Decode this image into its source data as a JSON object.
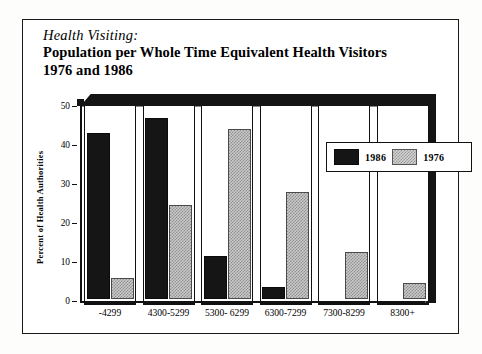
{
  "figure": {
    "title_sub": "Health Visiting:",
    "title_line1": "Population per Whole Time Equivalent Health Visitors",
    "title_line2": "1976 and 1986"
  },
  "legend": {
    "items": [
      {
        "label": "1986",
        "swatch": "solid-black-swatch"
      },
      {
        "label": "1976",
        "swatch": "dotted-grey-swatch"
      }
    ]
  },
  "axes": {
    "ylabel": "Percent of Health Authorities",
    "yticks": [
      "0",
      "10",
      "20",
      "30",
      "40",
      "50"
    ]
  },
  "chart_data": {
    "type": "bar",
    "title": "Health Visiting: Population per Whole Time Equivalent Health Visitors 1976 and 1986",
    "xlabel": "",
    "ylabel": "Percent of Health Authorities",
    "ylim": [
      0,
      50
    ],
    "yticks": [
      0,
      10,
      20,
      30,
      40,
      50
    ],
    "grid": false,
    "legend_position": "upper-right-inside",
    "categories": [
      "-4299",
      "4300-5299",
      "5300- 6299",
      "6300-7299",
      "7300-8299",
      "8300+"
    ],
    "series": [
      {
        "name": "1986",
        "values": [
          42.5,
          46.5,
          11.0,
          3.0,
          0.0,
          0.0
        ]
      },
      {
        "name": "1976",
        "values": [
          5.5,
          24.0,
          43.5,
          27.5,
          12.0,
          4.0
        ]
      }
    ]
  }
}
